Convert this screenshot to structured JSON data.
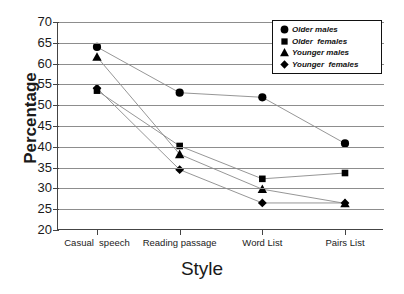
{
  "chart_data": {
    "type": "line",
    "title": "",
    "xlabel": "Style",
    "ylabel": "Percentage",
    "ylim": [
      20,
      70
    ],
    "ytick_step": 5,
    "yticks": [
      70,
      65,
      60,
      55,
      50,
      45,
      40,
      35,
      30,
      25,
      20
    ],
    "grid": true,
    "legend_position": "top-right",
    "categories": [
      "Casual  speech",
      "Reading passage",
      "Word List",
      "Pairs List"
    ],
    "series": [
      {
        "name": "Older males",
        "marker": "circle",
        "color": "#000000",
        "values": [
          64.0,
          53.0,
          51.9,
          40.8
        ]
      },
      {
        "name": "Older  females",
        "marker": "square",
        "color": "#000000",
        "values": [
          53.5,
          40.2,
          32.3,
          33.7
        ]
      },
      {
        "name": "Younger males",
        "marker": "triangle",
        "color": "#000000",
        "values": [
          61.6,
          38.2,
          29.8,
          26.4
        ]
      },
      {
        "name": "Younger  females",
        "marker": "diamond",
        "color": "#000000",
        "values": [
          54.1,
          34.5,
          26.5,
          26.5
        ]
      }
    ]
  },
  "colors": {
    "axis": "#444444",
    "grid": "#8d8d8d",
    "marker": "#000000",
    "line": "#8a8a8a",
    "background": "#ffffff"
  }
}
